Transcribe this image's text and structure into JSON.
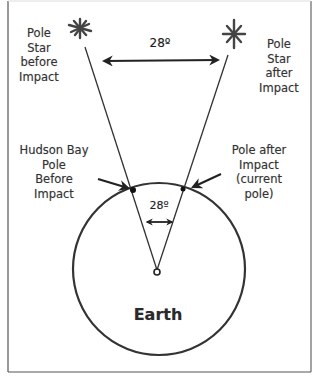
{
  "diagram": {
    "type": "pole-shift-illustration",
    "colors": {
      "background": "#ffffff",
      "line": "#333333",
      "frame": "#555555",
      "text": "#333333"
    },
    "labels": {
      "pole_star_before": "Pole\nStar\nbefore\nImpact",
      "pole_star_after": "Pole\nStar\nafter\nImpact",
      "angle_top": "28º",
      "angle_center": "28º",
      "hudson_bay_pole": "Hudson Bay\nPole\nBefore\nImpact",
      "pole_after": "Pole after\nImpact\n(current\npole)",
      "earth": "Earth"
    },
    "icons": {
      "star_before": "asterisk-star-icon",
      "star_after": "asterisk-star-icon"
    }
  }
}
